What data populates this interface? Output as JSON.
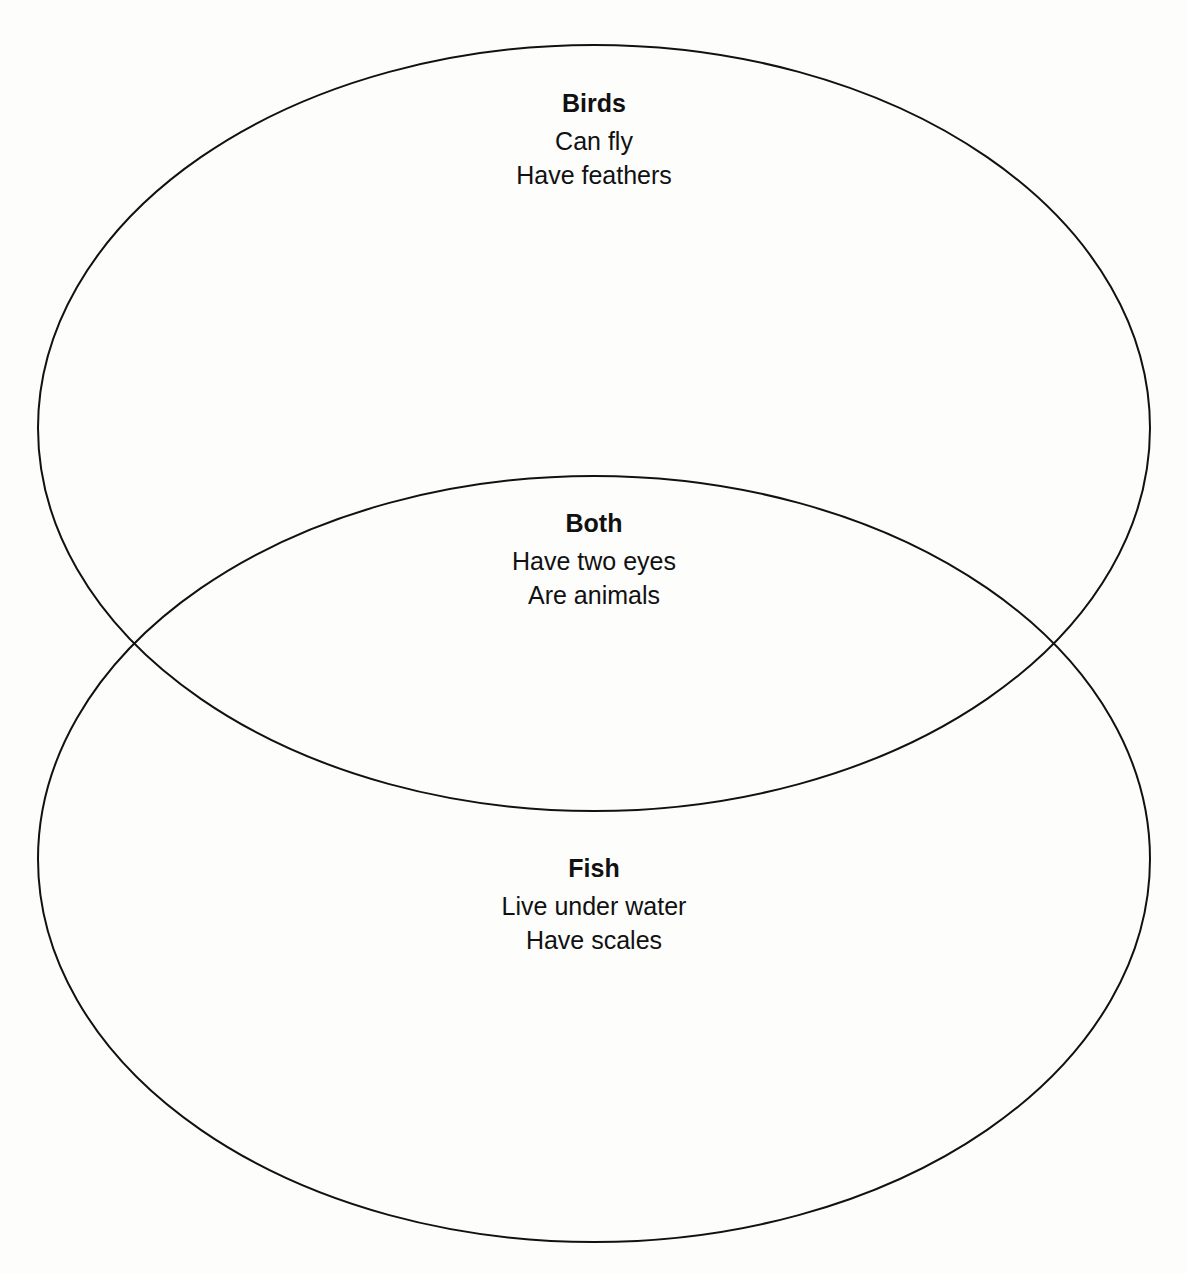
{
  "diagram": {
    "type": "venn",
    "stroke_color": "#111111",
    "background_color": "#fdfdfc",
    "sets": [
      {
        "id": "birds",
        "title": "Birds",
        "items": [
          "Can fly",
          "Have feathers"
        ],
        "ellipse": {
          "cx": 594,
          "cy": 428,
          "rx": 556,
          "ry": 383
        }
      },
      {
        "id": "fish",
        "title": "Fish",
        "items": [
          "Live under water",
          "Have scales"
        ],
        "ellipse": {
          "cx": 594,
          "cy": 859,
          "rx": 556,
          "ry": 383
        }
      }
    ],
    "intersection": {
      "title": "Both",
      "items": [
        "Have two eyes",
        "Are animals"
      ]
    }
  }
}
